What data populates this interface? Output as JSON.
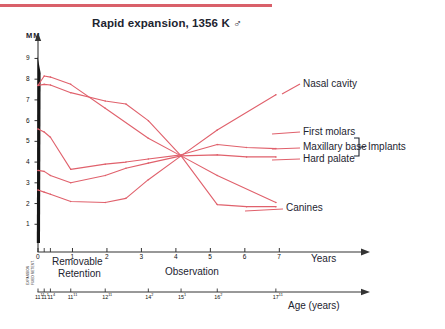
{
  "header": {
    "rule_color": "#d9606a"
  },
  "chart_data": {
    "type": "line",
    "title": "Rapid expansion, 1356 K ♂",
    "ylabel": "MM",
    "xlabel": "Years",
    "secondary_xlabel": "Age (years)",
    "ylim": [
      0,
      9.6
    ],
    "xlim": [
      0,
      7.6
    ],
    "yticks": [
      "9",
      "8",
      "7",
      "6",
      "5",
      "4",
      "3",
      "2",
      "1"
    ],
    "ytick_values": [
      9,
      8,
      7,
      6,
      5,
      4,
      3,
      2,
      1
    ],
    "xticks": [
      "0",
      "1",
      "2",
      "3",
      "4",
      "5",
      "6",
      "7"
    ],
    "xtick_values": [
      0,
      1,
      2,
      3,
      4,
      5,
      6,
      7
    ],
    "age_ticks": [
      {
        "label": "11",
        "sup": "11",
        "x": 0.0
      },
      {
        "label": "11",
        "sup": "1",
        "x": 0.18
      },
      {
        "label": "11",
        "sup": "4",
        "x": 0.36
      },
      {
        "label": "11",
        "sup": "11",
        "x": 0.95
      },
      {
        "label": "12",
        "sup": "11",
        "x": 1.95
      },
      {
        "label": "14",
        "sup": "2",
        "x": 3.2
      },
      {
        "label": "15",
        "sup": "1",
        "x": 4.15
      },
      {
        "label": "16",
        "sup": "2",
        "x": 5.2
      },
      {
        "label": "17",
        "sup": "11",
        "x": 6.9
      }
    ],
    "grid": false,
    "legend_position": "right-inline",
    "line_color": "#e0616c",
    "phases": [
      {
        "name": "expansion",
        "label": "EXPANSION",
        "orientation": "vertical"
      },
      {
        "name": "fixed-retention",
        "label": "FIXED RETENT.",
        "orientation": "vertical"
      },
      {
        "name": "removable-retention",
        "label": "Removable\nRetention",
        "line1": "Removable",
        "line2": "Retention"
      },
      {
        "name": "observation",
        "label": "Observation"
      }
    ],
    "bracket_label": "Implants",
    "series": [
      {
        "name": "Nasal cavity",
        "label": "Nasal cavity",
        "points": [
          {
            "x": 0.0,
            "y": 7.7
          },
          {
            "x": 0.18,
            "y": 8.15
          },
          {
            "x": 0.36,
            "y": 8.1
          },
          {
            "x": 0.95,
            "y": 7.75
          },
          {
            "x": 1.95,
            "y": 6.6
          },
          {
            "x": 3.2,
            "y": 5.15
          },
          {
            "x": 4.15,
            "y": 4.3
          },
          {
            "x": 5.2,
            "y": 5.55
          },
          {
            "x": 6.9,
            "y": 7.25
          }
        ]
      },
      {
        "name": "First molars",
        "label": "First molars",
        "points": [
          {
            "x": 0.0,
            "y": 7.7
          },
          {
            "x": 0.18,
            "y": 7.75
          },
          {
            "x": 0.36,
            "y": 7.72
          },
          {
            "x": 0.95,
            "y": 7.35
          },
          {
            "x": 1.95,
            "y": 6.95
          },
          {
            "x": 2.55,
            "y": 6.8
          },
          {
            "x": 3.2,
            "y": 6.0
          },
          {
            "x": 4.15,
            "y": 4.3
          },
          {
            "x": 5.2,
            "y": 3.35
          },
          {
            "x": 6.9,
            "y": 2.05
          }
        ]
      },
      {
        "name": "Maxillary base",
        "label": "Maxillary base",
        "points": [
          {
            "x": 0.0,
            "y": 5.6
          },
          {
            "x": 0.18,
            "y": 5.45
          },
          {
            "x": 0.36,
            "y": 5.2
          },
          {
            "x": 0.95,
            "y": 3.65
          },
          {
            "x": 1.95,
            "y": 3.9
          },
          {
            "x": 2.55,
            "y": 4.0
          },
          {
            "x": 3.2,
            "y": 4.15
          },
          {
            "x": 4.15,
            "y": 4.35
          },
          {
            "x": 5.2,
            "y": 4.85
          },
          {
            "x": 6.05,
            "y": 4.7
          },
          {
            "x": 6.9,
            "y": 4.65
          }
        ]
      },
      {
        "name": "Hard palate",
        "label": "Hard palate",
        "points": [
          {
            "x": 0.0,
            "y": 3.6
          },
          {
            "x": 0.18,
            "y": 3.55
          },
          {
            "x": 0.36,
            "y": 3.35
          },
          {
            "x": 0.95,
            "y": 3.0
          },
          {
            "x": 1.95,
            "y": 3.35
          },
          {
            "x": 2.55,
            "y": 3.7
          },
          {
            "x": 3.2,
            "y": 3.95
          },
          {
            "x": 4.15,
            "y": 4.3
          },
          {
            "x": 5.2,
            "y": 4.35
          },
          {
            "x": 6.05,
            "y": 4.25
          },
          {
            "x": 6.9,
            "y": 4.25
          }
        ]
      },
      {
        "name": "Canines",
        "label": "Canines",
        "points": [
          {
            "x": 0.0,
            "y": 2.65
          },
          {
            "x": 0.18,
            "y": 2.55
          },
          {
            "x": 0.36,
            "y": 2.45
          },
          {
            "x": 0.95,
            "y": 2.1
          },
          {
            "x": 1.95,
            "y": 2.05
          },
          {
            "x": 2.55,
            "y": 2.25
          },
          {
            "x": 3.2,
            "y": 3.15
          },
          {
            "x": 4.15,
            "y": 4.3
          },
          {
            "x": 5.2,
            "y": 1.95
          },
          {
            "x": 6.05,
            "y": 1.85
          },
          {
            "x": 6.9,
            "y": 1.85
          }
        ]
      }
    ]
  }
}
